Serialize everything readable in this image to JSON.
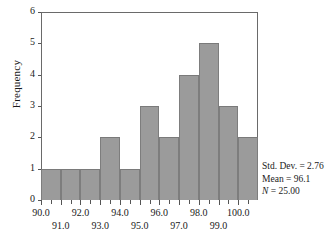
{
  "chart_data": {
    "type": "bar",
    "title": "",
    "subtitle": "",
    "xlabel": "",
    "ylabel": "Frequency",
    "xlim": [
      90.0,
      101.0
    ],
    "ylim": [
      0,
      6
    ],
    "grid": false,
    "legend": null,
    "bin_width": 1.0,
    "categories": [
      "90.0-91.0",
      "91.0-92.0",
      "92.0-93.0",
      "93.0-94.0",
      "94.0-95.0",
      "95.0-96.0",
      "96.0-97.0",
      "97.0-98.0",
      "98.0-99.0",
      "99.0-100.0",
      "100.0-101.0"
    ],
    "bin_edges": [
      90.0,
      91.0,
      92.0,
      93.0,
      94.0,
      95.0,
      96.0,
      97.0,
      98.0,
      99.0,
      100.0,
      101.0
    ],
    "values": [
      1,
      1,
      1,
      2,
      1,
      3,
      2,
      4,
      5,
      3,
      2
    ],
    "x_tick_labels": [
      "90.0",
      "91.0",
      "92.0",
      "93.0",
      "94.0",
      "95.0",
      "96.0",
      "97.0",
      "98.0",
      "99.0",
      "100.0"
    ],
    "x_tick_values": [
      90.0,
      91.0,
      92.0,
      93.0,
      94.0,
      95.0,
      96.0,
      97.0,
      98.0,
      99.0,
      100.0
    ],
    "y_tick_labels": [
      "0",
      "1",
      "2",
      "3",
      "4",
      "5",
      "6"
    ],
    "y_tick_values": [
      0,
      1,
      2,
      3,
      4,
      5,
      6
    ],
    "bar_color": "#9b9b9b",
    "bar_edge_color": "#7d7d7d",
    "axis_color": "#6a6a6a",
    "background_color": "#ffffff"
  },
  "axes": {
    "y_title": "Frequency"
  },
  "stats": {
    "std_dev_line": "Std. Dev. = 2.76",
    "mean_line": "Mean = 96.1",
    "n_symbol": "N",
    "n_value_line": " = 25.00",
    "std_dev": 2.76,
    "mean": 96.1,
    "n": 25.0
  }
}
